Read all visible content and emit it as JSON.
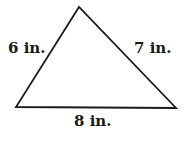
{
  "diagram": {
    "type": "triangle",
    "vertices": {
      "top": [
        79,
        7
      ],
      "bottom_left": [
        16,
        107
      ],
      "bottom_right": [
        176,
        108
      ]
    },
    "stroke_color": "#1a1a1a",
    "sides": [
      {
        "id": "left",
        "label": "6 in.",
        "length": 6,
        "unit": "in."
      },
      {
        "id": "right",
        "label": "7 in.",
        "length": 7,
        "unit": "in."
      },
      {
        "id": "bottom",
        "label": "8 in.",
        "length": 8,
        "unit": "in."
      }
    ]
  }
}
